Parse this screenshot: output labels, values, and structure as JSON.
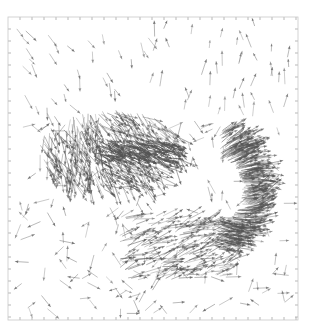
{
  "chart_data": {
    "type": "quiver",
    "title": "",
    "xlabel": "",
    "ylabel": "",
    "grid": false,
    "legend": null,
    "frame": {
      "left": 8,
      "top": 17,
      "right": 298,
      "bottom": 320
    },
    "ticks": {
      "x_spacing_px": 12,
      "y_spacing_px": 12,
      "tick_labels": []
    },
    "colors": {
      "arrow": "#555555",
      "frame": "#c8c8c8",
      "tick": "#9a9a9a",
      "background": "#ffffff"
    },
    "features": [
      {
        "name": "dense-cluster-left",
        "kind": "source",
        "cx": 120,
        "cy": 150,
        "rx": 55,
        "ry": 25,
        "density": "high",
        "direction": "radiating, mostly down-right"
      },
      {
        "name": "arc-ring-right",
        "kind": "sink-arc",
        "cx": 245,
        "cy": 190,
        "radius": 45,
        "arc_span_deg": [
          90,
          270
        ],
        "density": "high",
        "direction": "pointing toward arc from left"
      },
      {
        "name": "lower-fan",
        "kind": "fan",
        "cx": 180,
        "cy": 250,
        "density": "medium",
        "direction": "down-right"
      }
    ],
    "background_arrows": {
      "density": "low",
      "typical_length_px": [
        8,
        16
      ],
      "dominant_direction": "down-right in upper half, mixed elsewhere"
    }
  }
}
